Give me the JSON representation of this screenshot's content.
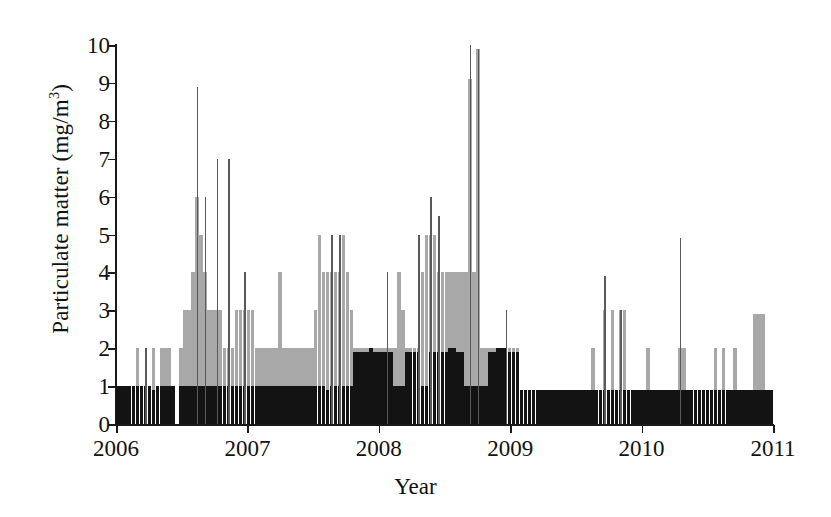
{
  "chart_data": {
    "type": "bar",
    "title": "",
    "xlabel": "Year",
    "ylabel": "Particulate matter (mg/m3)",
    "ylabel_html": "Particulate matter (mg/m<sup>3</sup>)",
    "ylabel_units": "mg/m^3",
    "xlim": [
      2006,
      2011
    ],
    "ylim": [
      0,
      10
    ],
    "ytick_labels": [
      "10",
      "9",
      "8",
      "7",
      "6",
      "5",
      "4",
      "3",
      "2",
      "1",
      "0"
    ],
    "ytick_values": [
      10,
      9,
      8,
      7,
      6,
      5,
      4,
      3,
      2,
      1,
      0
    ],
    "xtick_labels": [
      "2006",
      "2007",
      "2008",
      "2009",
      "2010",
      "2011"
    ],
    "xtick_values": [
      2006,
      2007,
      2008,
      2009,
      2010,
      2011
    ],
    "grid": false,
    "legend": false,
    "colors": {
      "dark_bar": "#131313",
      "mid_bar": "#a8a8a8",
      "spike": "#5a5a5a",
      "axis": "#1a1a1a",
      "background": "#ffffff"
    },
    "series": [
      {
        "name": "lower level (black)",
        "color": "#131313",
        "values": [
          1.0,
          1.0,
          1.0,
          1.0,
          1.0,
          1.0,
          1.0,
          1.0,
          1.0,
          0.9,
          1.0,
          1.0,
          1.0,
          1.0,
          1.0,
          0.0,
          1.0,
          1.0,
          1.0,
          1.0,
          1.0,
          1.0,
          1.0,
          1.0,
          1.0,
          1.0,
          1.0,
          1.0,
          1.0,
          1.0,
          1.0,
          1.0,
          1.0,
          1.0,
          1.0,
          1.0,
          1.0,
          1.0,
          1.0,
          1.0,
          1.0,
          1.0,
          1.0,
          1.0,
          1.0,
          1.0,
          1.0,
          1.0,
          1.0,
          1.0,
          1.0,
          1.0,
          1.0,
          0.9,
          1.0,
          1.0,
          1.0,
          1.0,
          1.0,
          1.0,
          1.9,
          1.9,
          1.9,
          1.9,
          2.0,
          1.9,
          1.9,
          1.9,
          1.9,
          1.9,
          1.0,
          1.0,
          1.0,
          1.9,
          1.9,
          1.9,
          1.9,
          1.0,
          1.0,
          1.9,
          1.9,
          1.9,
          1.9,
          1.9,
          2.0,
          2.0,
          1.9,
          1.9,
          1.0,
          1.0,
          1.0,
          1.0,
          1.0,
          1.0,
          1.9,
          1.9,
          2.0,
          2.0,
          2.0,
          1.9,
          1.9,
          1.9,
          0.9,
          0.9,
          0.9,
          0.9,
          0.9,
          0.9,
          0.9,
          0.9,
          0.9,
          0.9,
          0.9,
          0.9,
          0.9,
          0.9,
          0.9,
          0.9,
          0.9,
          0.9,
          0.9,
          0.9,
          0.9,
          0.9,
          0.9,
          0.9,
          0.9,
          0.9,
          0.9,
          0.9,
          0.9,
          0.9,
          0.9,
          0.9,
          0.9,
          0.9,
          0.9,
          0.9,
          0.9,
          0.9,
          0.9,
          0.9,
          0.9,
          0.9,
          0.9,
          0.9,
          0.9,
          0.9,
          0.9,
          0.9,
          0.9,
          0.9,
          0.9,
          0.9,
          0.9,
          0.9,
          0.9,
          0.9,
          0.9,
          0.9,
          0.9,
          0.9,
          0.9,
          0.9,
          0.9,
          0.9
        ]
      },
      {
        "name": "upper level (grey)",
        "color": "#a8a8a8",
        "values": [
          1.0,
          1.0,
          1.0,
          1.0,
          1.0,
          2.0,
          1.0,
          1.0,
          1.0,
          2.0,
          1.0,
          2.0,
          2.0,
          2.0,
          1.0,
          0.0,
          2.0,
          3.0,
          3.0,
          4.0,
          6.0,
          5.0,
          4.0,
          3.0,
          3.0,
          3.0,
          3.0,
          2.0,
          2.0,
          2.0,
          3.0,
          3.0,
          3.0,
          3.0,
          3.0,
          2.0,
          2.0,
          2.0,
          2.0,
          2.0,
          2.0,
          4.0,
          2.0,
          2.0,
          2.0,
          2.0,
          2.0,
          2.0,
          2.0,
          2.0,
          3.0,
          5.0,
          4.0,
          4.0,
          4.0,
          4.0,
          4.0,
          5.0,
          4.0,
          3.0,
          2.0,
          2.0,
          2.0,
          2.0,
          2.0,
          2.0,
          2.0,
          2.0,
          2.0,
          2.0,
          2.0,
          4.0,
          3.0,
          2.0,
          2.0,
          2.0,
          2.0,
          4.0,
          5.0,
          5.0,
          5.0,
          4.0,
          4.0,
          4.0,
          4.0,
          4.0,
          4.0,
          4.0,
          4.0,
          9.1,
          4.0,
          9.9,
          2.0,
          2.0,
          2.0,
          2.0,
          2.0,
          2.0,
          2.0,
          2.0,
          2.0,
          2.0,
          0.9,
          0.9,
          0.9,
          0.9,
          0.9,
          0.9,
          0.9,
          0.9,
          0.9,
          0.9,
          0.9,
          0.9,
          0.9,
          0.9,
          0.9,
          0.9,
          0.9,
          0.9,
          2.0,
          0.9,
          0.9,
          3.0,
          0.9,
          3.0,
          0.9,
          3.0,
          3.0,
          0.9,
          0.9,
          0.9,
          0.9,
          0.9,
          2.0,
          0.9,
          0.9,
          0.9,
          0.9,
          0.9,
          0.9,
          0.9,
          2.0,
          2.0,
          0.9,
          0.9,
          0.9,
          0.9,
          0.9,
          0.9,
          0.9,
          2.0,
          0.9,
          2.0,
          0.9,
          0.9,
          2.0,
          0.9,
          0.9,
          0.9,
          0.9,
          2.9,
          2.9,
          2.9,
          0.9,
          0.9
        ]
      },
      {
        "name": "maximum (spike)",
        "color": "#5a5a5a",
        "values": [
          0,
          0,
          0,
          0,
          0,
          0,
          0,
          2.0,
          0,
          0,
          0,
          0,
          0,
          0,
          0,
          0,
          0,
          0,
          0,
          0,
          8.9,
          0,
          6.0,
          0,
          0,
          7.0,
          0,
          0,
          7.0,
          0,
          0,
          0,
          4.0,
          0,
          0,
          0,
          0,
          0,
          0,
          0,
          0,
          0,
          0,
          0,
          0,
          0,
          0,
          0,
          0,
          0,
          0,
          0,
          0,
          0,
          5.0,
          0,
          5.0,
          0,
          0,
          0,
          0,
          0,
          0,
          0,
          0,
          0,
          0,
          0,
          4.0,
          0,
          0,
          0,
          0,
          0,
          0,
          0,
          5.0,
          0,
          0,
          6.0,
          0,
          5.5,
          0,
          0,
          0,
          0,
          0,
          0,
          0,
          10.0,
          0,
          9.9,
          0,
          0,
          0,
          0,
          0,
          0,
          3.0,
          0,
          0,
          0,
          0,
          0,
          0,
          0,
          0,
          0,
          0,
          0,
          0,
          0,
          0,
          0,
          0,
          0,
          0,
          0,
          0,
          0,
          0,
          0,
          0,
          3.9,
          0,
          0,
          0,
          3.0,
          0,
          0,
          0,
          0,
          0,
          0,
          0,
          0,
          0,
          0,
          0,
          0,
          0,
          0,
          4.9,
          0,
          0,
          0,
          0,
          0,
          0,
          0,
          0,
          0,
          0,
          0,
          0,
          0,
          0,
          0,
          0,
          0,
          0,
          0,
          0,
          0,
          0,
          0
        ]
      }
    ],
    "peak_value": 10.0,
    "peak_year": 2009,
    "n_points": 154
  }
}
